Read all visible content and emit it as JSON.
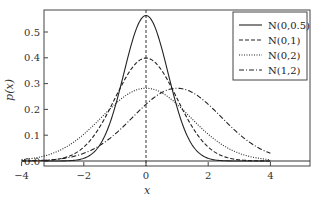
{
  "chart_data": {
    "type": "line",
    "title": "",
    "xlabel": "x",
    "ylabel": "p(x)",
    "xlim": [
      -4.3,
      4.3
    ],
    "ylim": [
      -0.02,
      0.58
    ],
    "xticks": [
      -4,
      -2,
      0,
      2,
      4
    ],
    "xtick_labels": [
      "−4",
      "−2",
      "0",
      "2",
      "4"
    ],
    "yticks": [
      0.0,
      0.1,
      0.2,
      0.3,
      0.4,
      0.5
    ],
    "ytick_labels": [
      "0.0",
      "0.1",
      "0.2",
      "0.3",
      "0.4",
      "0.5"
    ],
    "grid": false,
    "legend_position": "upper right",
    "vline": {
      "x": 0,
      "style": "dashed"
    },
    "hline": {
      "y": 0,
      "style": "solid"
    },
    "x_range": [
      -4,
      4
    ],
    "series": [
      {
        "name": "N(0,0.5)",
        "label": "N(0,0.5)",
        "mu": 0,
        "variance": 0.5,
        "style": "solid",
        "peak": 0.564
      },
      {
        "name": "N(0,1)",
        "label": "N(0,1)",
        "mu": 0,
        "variance": 1,
        "style": "dashed",
        "peak": 0.399
      },
      {
        "name": "N(0,2)",
        "label": "N(0,2)",
        "mu": 0,
        "variance": 2,
        "style": "dotted",
        "peak": 0.282
      },
      {
        "name": "N(1,2)",
        "label": "N(1,2)",
        "mu": 1,
        "variance": 2,
        "style": "dashdot",
        "peak": 0.282
      }
    ]
  },
  "legend": {
    "items": [
      "N(0,0.5)",
      "N(0,1)",
      "N(0,2)",
      "N(1,2)"
    ]
  },
  "axes": {
    "xlabel": "x",
    "ylabel": "p(x)"
  }
}
